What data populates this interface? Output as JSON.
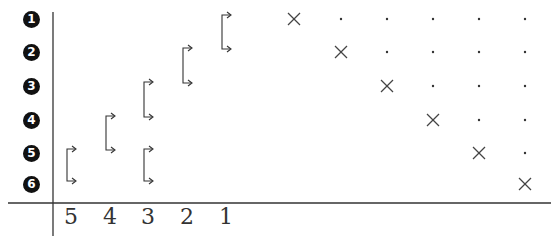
{
  "diagram": {
    "row_labels": [
      "1",
      "2",
      "3",
      "4",
      "5",
      "6"
    ],
    "column_labels": [
      "5",
      "4",
      "3",
      "2",
      "1"
    ],
    "matrix": {
      "size": 6,
      "diagonal_marker": "x-mark",
      "upper_marker": "dot",
      "lower_marker": "empty"
    },
    "brackets": [
      {
        "column": "5",
        "from_row": 5,
        "to_row": 6
      },
      {
        "column": "4",
        "from_row": 4,
        "to_row": 5
      },
      {
        "column": "3",
        "from_row": 3,
        "to_row": 4
      },
      {
        "column": "3",
        "from_row": 5,
        "to_row": 6
      },
      {
        "column": "2",
        "from_row": 2,
        "to_row": 3
      },
      {
        "column": "1",
        "from_row": 1,
        "to_row": 2
      }
    ]
  }
}
